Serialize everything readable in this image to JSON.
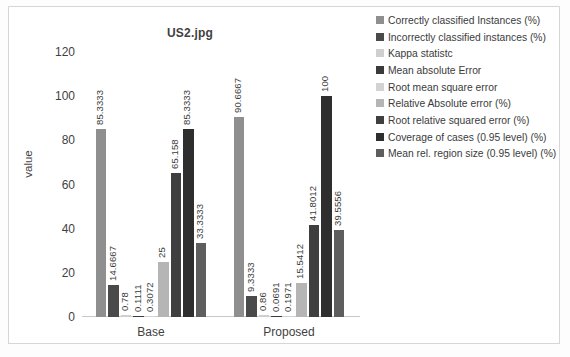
{
  "chart_data": {
    "type": "bar",
    "title": "US2.jpg",
    "xlabel": "",
    "ylabel": "value",
    "ylim": [
      0,
      120
    ],
    "yticks": [
      "0",
      "20",
      "40",
      "60",
      "80",
      "100",
      "120"
    ],
    "grid": false,
    "legend_position": "right",
    "categories": [
      "Base",
      "Proposed"
    ],
    "series": [
      {
        "name": "Correctly classified Instances (%)",
        "color": "#8f8f8f",
        "values": [
          85.3333,
          90.6667
        ],
        "labels": [
          "85.3333",
          "90.6667"
        ]
      },
      {
        "name": "Incorrectly classified instances (%)",
        "color": "#4a4a4a",
        "values": [
          14.6667,
          9.3333
        ],
        "labels": [
          "14.6667",
          "9.3333"
        ]
      },
      {
        "name": "Kappa statistc",
        "color": "#cfcfcf",
        "values": [
          0.78,
          0.86
        ],
        "labels": [
          "0.78",
          "0.86"
        ]
      },
      {
        "name": "Mean absolute Error",
        "color": "#3a3a3a",
        "values": [
          0.1111,
          0.0691
        ],
        "labels": [
          "0.1111",
          "0.0691"
        ]
      },
      {
        "name": "Root mean square error",
        "color": "#d3d3d3",
        "values": [
          0.3072,
          0.1971
        ],
        "labels": [
          "0.3072",
          "0.1971"
        ]
      },
      {
        "name": "Relative Absolute error (%)",
        "color": "#b5b5b5",
        "values": [
          25,
          15.5412
        ],
        "labels": [
          "25",
          "15.5412"
        ]
      },
      {
        "name": "Root relative squared error (%)",
        "color": "#3f3f3f",
        "values": [
          65.158,
          41.8012
        ],
        "labels": [
          "65.158",
          "41.8012"
        ]
      },
      {
        "name": "Coverage of cases (0.95 level) (%)",
        "color": "#2e2e2e",
        "values": [
          85.3333,
          100
        ],
        "labels": [
          "85.3333",
          "100"
        ]
      },
      {
        "name": "Mean rel. region size (0.95 level) (%)",
        "color": "#5e5e5e",
        "values": [
          33.3333,
          39.5556
        ],
        "labels": [
          "33.3333",
          "39.5556"
        ]
      }
    ]
  },
  "legend": {
    "items": [
      {
        "label": "Correctly classified Instances (%)",
        "color": "#8f8f8f"
      },
      {
        "label": "Incorrectly classified instances (%)",
        "color": "#4a4a4a"
      },
      {
        "label": "Kappa statistc",
        "color": "#cfcfcf"
      },
      {
        "label": "Mean absolute Error",
        "color": "#3a3a3a"
      },
      {
        "label": "Root mean square error",
        "color": "#d3d3d3"
      },
      {
        "label": "Relative Absolute error (%)",
        "color": "#b5b5b5"
      },
      {
        "label": "Root relative squared error (%)",
        "color": "#3f3f3f"
      },
      {
        "label": "Coverage of cases (0.95 level) (%)",
        "color": "#2e2e2e"
      },
      {
        "label": "Mean rel. region size (0.95 level) (%)",
        "color": "#5e5e5e"
      }
    ]
  }
}
